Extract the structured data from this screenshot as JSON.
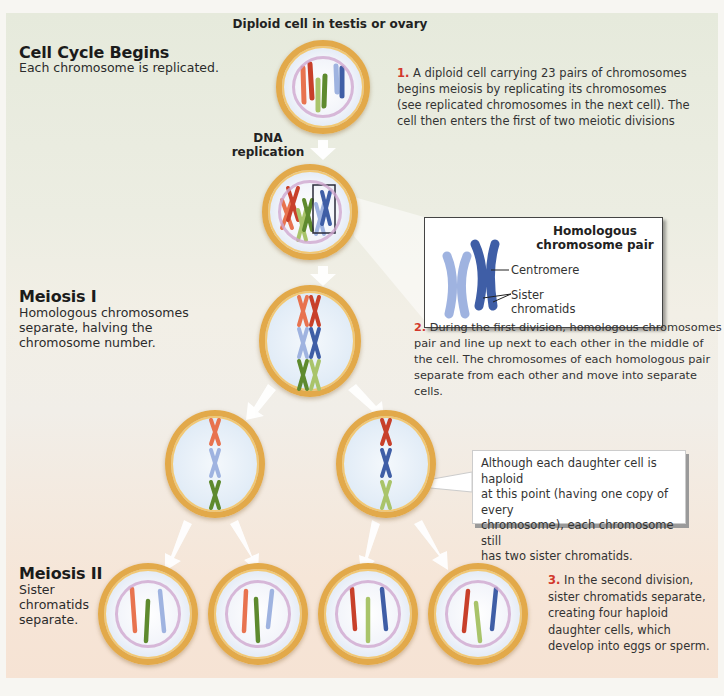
{
  "top_label": "Diploid cell in testis or ovary",
  "sections": {
    "cell_cycle": {
      "title": "Cell Cycle Begins",
      "subtitle": "Each chromosome is replicated."
    },
    "meiosis1": {
      "title": "Meiosis I",
      "subtitle_lines": [
        "Homologous chromosomes",
        "separate, halving the",
        "chromosome number."
      ]
    },
    "meiosis2": {
      "title": "Meiosis II",
      "subtitle_lines": [
        "Sister",
        "chromatids",
        "separate."
      ]
    }
  },
  "dna_replication_label": [
    "DNA",
    "replication"
  ],
  "steps": [
    {
      "num": "1.",
      "lines": [
        "A diploid cell carrying 23 pairs of chromosomes",
        "begins meiosis by replicating its chromosomes",
        "(see replicated chromosomes in the next cell). The",
        "cell then enters the first of two meiotic divisions"
      ]
    },
    {
      "num": "2.",
      "lines": [
        "During the first division, homologous chromosomes",
        "pair and line up next to each other in the middle of",
        "the cell. The chromosomes of each homologous pair",
        "separate from each other and move into separate cells."
      ]
    },
    {
      "num": "3.",
      "lines": [
        "In the second division,",
        "sister chromatids separate,",
        "creating four haploid",
        "daughter cells, which",
        "develop into eggs or sperm."
      ]
    }
  ],
  "inset": {
    "title_lines": [
      "Homologous",
      "chromosome pair"
    ],
    "labels": {
      "centromere": "Centromere",
      "sister": "Sister",
      "chromatids": "chromatids"
    }
  },
  "callout": {
    "lines": [
      "Although each daughter cell is haploid",
      "at this point (having one copy of every",
      "chromosome), each chromosome still",
      "has two sister chromatids."
    ]
  },
  "colors": {
    "cell_border": "#e2a94a",
    "step_number": "#d2382c",
    "chrom_orange": "#e8734f",
    "chrom_red": "#c8402a",
    "chrom_green_dark": "#5e8a2e",
    "chrom_green_light": "#a9c46a",
    "chrom_blue_light": "#9fb3e0",
    "chrom_blue_dark": "#3f5ea6"
  }
}
